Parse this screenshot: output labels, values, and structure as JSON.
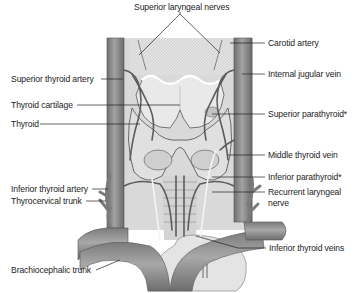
{
  "figure": {
    "labels": {
      "top": "Superior laryngeal nerves",
      "left": [
        "Superior thyroid artery",
        "Thyroid cartilage",
        "Thyroid",
        "Inferior thyroid artery",
        "Thyrocervical trunk",
        "Brachiocephalic trunk"
      ],
      "right": [
        "Carotid artery",
        "Internal jugular vein",
        "Superior parathyroid*",
        "Middle thyroid vein",
        "Inferior parathyroid*",
        "Recurrent laryngeal",
        "nerve",
        "Inferior thyroid veins"
      ]
    },
    "colors": {
      "background": "#ffffff",
      "vessel": "#8a8a8a",
      "vessel_dark": "#5e5e5e",
      "tissue": "#d6d6d6",
      "cartilage": "#ececec",
      "line": "#222222",
      "text": "#1c1c1c"
    }
  }
}
